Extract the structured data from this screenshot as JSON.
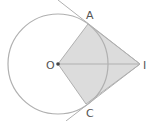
{
  "diagram": {
    "points": {
      "O": {
        "label": "O",
        "x": 58,
        "y": 64
      },
      "A": {
        "label": "A",
        "x": 88,
        "y": 24
      },
      "C": {
        "label": "C",
        "x": 86,
        "y": 104
      },
      "I": {
        "label": "I",
        "x": 140,
        "y": 64
      }
    },
    "circle": {
      "center": "O",
      "radius": 50
    },
    "colors": {
      "stroke": "#b0b0b0",
      "fill": "#dcdcdc",
      "point": "#444444",
      "label": "#555555"
    }
  }
}
